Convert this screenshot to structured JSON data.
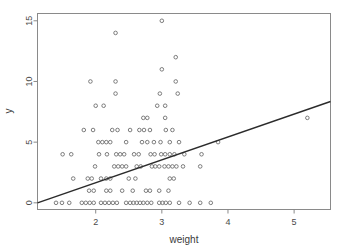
{
  "chart_data": {
    "type": "scatter",
    "title": "",
    "xlabel": "weight",
    "ylabel": "y",
    "xlim": [
      1.12,
      5.55
    ],
    "ylim": [
      -0.55,
      15.6
    ],
    "xticks": [
      2,
      3,
      4,
      5
    ],
    "yticks": [
      0,
      5,
      10,
      15
    ],
    "grid": false,
    "legend": null,
    "marker": "open-circle",
    "marker_color": "#6e6e6e",
    "line_color": "#2b2b2b",
    "background": "#ffffff",
    "border_color": "#8a8a8a",
    "fit_line": {
      "type": "line",
      "label": "regression line",
      "x": [
        1.12,
        5.55
      ],
      "y": [
        0.0,
        8.35
      ],
      "slope": 1.886,
      "intercept": -2.112
    },
    "points": [
      {
        "x": 3.0,
        "y": 15
      },
      {
        "x": 2.3,
        "y": 14
      },
      {
        "x": 3.21,
        "y": 12
      },
      {
        "x": 3.0,
        "y": 11
      },
      {
        "x": 1.92,
        "y": 10
      },
      {
        "x": 2.3,
        "y": 10
      },
      {
        "x": 3.21,
        "y": 10
      },
      {
        "x": 2.3,
        "y": 9
      },
      {
        "x": 2.97,
        "y": 9
      },
      {
        "x": 3.24,
        "y": 9
      },
      {
        "x": 2.0,
        "y": 8
      },
      {
        "x": 2.12,
        "y": 8
      },
      {
        "x": 2.93,
        "y": 8
      },
      {
        "x": 3.05,
        "y": 8
      },
      {
        "x": 2.72,
        "y": 7
      },
      {
        "x": 2.78,
        "y": 7
      },
      {
        "x": 3.05,
        "y": 7
      },
      {
        "x": 5.2,
        "y": 7
      },
      {
        "x": 1.82,
        "y": 6
      },
      {
        "x": 1.96,
        "y": 6
      },
      {
        "x": 2.25,
        "y": 6
      },
      {
        "x": 2.33,
        "y": 6
      },
      {
        "x": 2.52,
        "y": 6
      },
      {
        "x": 2.66,
        "y": 6
      },
      {
        "x": 2.73,
        "y": 6
      },
      {
        "x": 2.82,
        "y": 6
      },
      {
        "x": 3.06,
        "y": 6
      },
      {
        "x": 3.16,
        "y": 6
      },
      {
        "x": 2.04,
        "y": 5
      },
      {
        "x": 2.1,
        "y": 5
      },
      {
        "x": 2.16,
        "y": 5
      },
      {
        "x": 2.22,
        "y": 5
      },
      {
        "x": 2.46,
        "y": 5
      },
      {
        "x": 2.7,
        "y": 5
      },
      {
        "x": 2.78,
        "y": 5
      },
      {
        "x": 2.88,
        "y": 5
      },
      {
        "x": 2.98,
        "y": 5
      },
      {
        "x": 3.12,
        "y": 5
      },
      {
        "x": 3.26,
        "y": 5
      },
      {
        "x": 3.85,
        "y": 5
      },
      {
        "x": 1.5,
        "y": 4
      },
      {
        "x": 1.63,
        "y": 4
      },
      {
        "x": 2.05,
        "y": 4
      },
      {
        "x": 2.17,
        "y": 4
      },
      {
        "x": 2.31,
        "y": 4
      },
      {
        "x": 2.37,
        "y": 4
      },
      {
        "x": 2.43,
        "y": 4
      },
      {
        "x": 2.58,
        "y": 4
      },
      {
        "x": 2.65,
        "y": 4
      },
      {
        "x": 2.83,
        "y": 4
      },
      {
        "x": 2.89,
        "y": 4
      },
      {
        "x": 2.99,
        "y": 4
      },
      {
        "x": 3.05,
        "y": 4
      },
      {
        "x": 3.12,
        "y": 4
      },
      {
        "x": 3.19,
        "y": 4
      },
      {
        "x": 3.34,
        "y": 4
      },
      {
        "x": 3.6,
        "y": 4
      },
      {
        "x": 1.99,
        "y": 3
      },
      {
        "x": 2.28,
        "y": 3
      },
      {
        "x": 2.34,
        "y": 3
      },
      {
        "x": 2.4,
        "y": 3
      },
      {
        "x": 2.46,
        "y": 3
      },
      {
        "x": 2.62,
        "y": 3
      },
      {
        "x": 2.68,
        "y": 3
      },
      {
        "x": 2.85,
        "y": 3
      },
      {
        "x": 2.9,
        "y": 3
      },
      {
        "x": 2.96,
        "y": 3
      },
      {
        "x": 3.04,
        "y": 3
      },
      {
        "x": 3.1,
        "y": 3
      },
      {
        "x": 3.16,
        "y": 3
      },
      {
        "x": 3.22,
        "y": 3
      },
      {
        "x": 3.32,
        "y": 3
      },
      {
        "x": 3.58,
        "y": 3
      },
      {
        "x": 1.66,
        "y": 2
      },
      {
        "x": 1.88,
        "y": 2
      },
      {
        "x": 1.94,
        "y": 2
      },
      {
        "x": 2.08,
        "y": 2
      },
      {
        "x": 2.16,
        "y": 2
      },
      {
        "x": 2.22,
        "y": 2
      },
      {
        "x": 2.5,
        "y": 2
      },
      {
        "x": 2.6,
        "y": 2
      },
      {
        "x": 3.12,
        "y": 2
      },
      {
        "x": 3.18,
        "y": 2
      },
      {
        "x": 1.9,
        "y": 1
      },
      {
        "x": 1.97,
        "y": 1
      },
      {
        "x": 2.16,
        "y": 1
      },
      {
        "x": 2.22,
        "y": 1
      },
      {
        "x": 2.4,
        "y": 1
      },
      {
        "x": 2.56,
        "y": 1
      },
      {
        "x": 2.76,
        "y": 1
      },
      {
        "x": 2.82,
        "y": 1
      },
      {
        "x": 2.96,
        "y": 1
      },
      {
        "x": 3.1,
        "y": 1
      },
      {
        "x": 1.4,
        "y": 0
      },
      {
        "x": 1.49,
        "y": 0
      },
      {
        "x": 1.6,
        "y": 0
      },
      {
        "x": 1.79,
        "y": 0
      },
      {
        "x": 1.85,
        "y": 0
      },
      {
        "x": 1.91,
        "y": 0
      },
      {
        "x": 1.97,
        "y": 0
      },
      {
        "x": 2.08,
        "y": 0
      },
      {
        "x": 2.14,
        "y": 0
      },
      {
        "x": 2.2,
        "y": 0
      },
      {
        "x": 2.26,
        "y": 0
      },
      {
        "x": 2.32,
        "y": 0
      },
      {
        "x": 2.46,
        "y": 0
      },
      {
        "x": 2.52,
        "y": 0
      },
      {
        "x": 2.57,
        "y": 0
      },
      {
        "x": 2.62,
        "y": 0
      },
      {
        "x": 2.67,
        "y": 0
      },
      {
        "x": 2.72,
        "y": 0
      },
      {
        "x": 2.78,
        "y": 0
      },
      {
        "x": 2.84,
        "y": 0
      },
      {
        "x": 2.96,
        "y": 0
      },
      {
        "x": 3.01,
        "y": 0
      },
      {
        "x": 3.06,
        "y": 0
      },
      {
        "x": 3.12,
        "y": 0
      },
      {
        "x": 3.26,
        "y": 0
      },
      {
        "x": 3.42,
        "y": 0
      },
      {
        "x": 3.58,
        "y": 0
      },
      {
        "x": 3.74,
        "y": 0
      }
    ]
  }
}
